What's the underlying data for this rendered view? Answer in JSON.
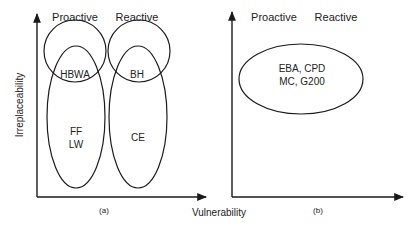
{
  "panel_a": {
    "caption": "(a)",
    "header_left": "Proactive",
    "header_right": "Reactive",
    "y_axis_label": "Irreplaceability",
    "regions": {
      "top_left": "HBWA",
      "top_right": "BH",
      "bottom_left_line1": "FF",
      "bottom_left_line2": "LW",
      "bottom_right": "CE"
    }
  },
  "panel_b": {
    "caption": "(b)",
    "header_left": "Proactive",
    "header_right": "Reactive",
    "region_line1": "EBA, CPD",
    "region_line2": "MC, G200"
  },
  "shared": {
    "x_axis_label": "Vulnerability"
  },
  "colors": {
    "stroke": "#1a1a1a",
    "text": "#222222",
    "background": "#ffffff"
  }
}
